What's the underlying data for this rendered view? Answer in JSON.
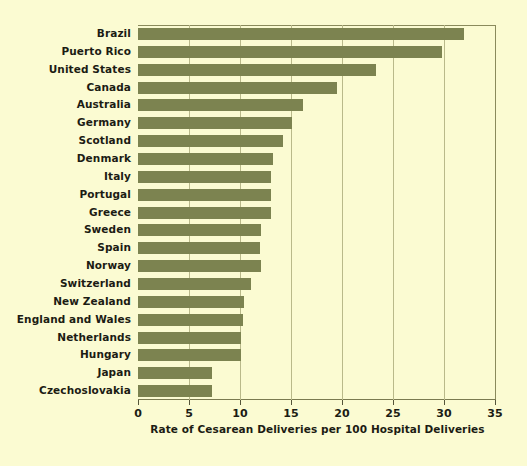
{
  "chart_data": {
    "type": "bar",
    "orientation": "horizontal",
    "title": "",
    "subtitle": "",
    "xlabel": "Rate of Cesarean Deliveries per 100 Hospital Deliveries",
    "ylabel": "",
    "xlim": [
      0,
      35
    ],
    "ylim": null,
    "grid": "vertical-gridlines-only",
    "legend": null,
    "xticks": [
      0,
      5,
      10,
      15,
      20,
      25,
      30,
      35
    ],
    "xtick_labels": [
      "0",
      "5",
      "10",
      "15",
      "20",
      "25",
      "30",
      "35"
    ],
    "bar_color": "#7c8350",
    "background_color": "#fbfbd2",
    "gridline_color": "#b9b98a",
    "categories": [
      "Brazil",
      "Puerto Rico",
      "United States",
      "Canada",
      "Australia",
      "Germany",
      "Scotland",
      "Denmark",
      "Italy",
      "Portugal",
      "Greece",
      "Sweden",
      "Spain",
      "Norway",
      "Switzerland",
      "New Zealand",
      "England and Wales",
      "Netherlands",
      "Hungary",
      "Japan",
      "Czechoslovakia"
    ],
    "values": [
      32.0,
      29.8,
      23.3,
      19.5,
      16.2,
      15.1,
      14.2,
      13.2,
      13.0,
      13.0,
      13.0,
      12.1,
      12.0,
      12.1,
      11.1,
      10.4,
      10.3,
      10.1,
      10.1,
      7.3,
      7.3
    ]
  }
}
